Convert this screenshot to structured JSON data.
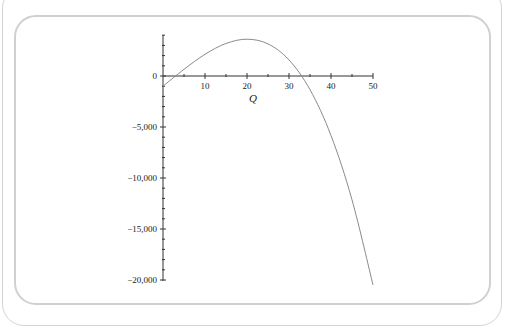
{
  "chart_data": {
    "type": "line",
    "title": "",
    "xlabel": "Q",
    "ylabel": "",
    "xlim": [
      0,
      50
    ],
    "ylim": [
      -20500,
      4000
    ],
    "x_ticks": [
      10,
      20,
      30,
      40,
      50
    ],
    "x_tick_labels": [
      "10",
      "20",
      "30",
      "40",
      "50"
    ],
    "y_ticks": [
      0,
      -5000,
      -10000,
      -15000,
      -20000
    ],
    "y_tick_labels": [
      "0",
      "-5,000",
      "-10,000",
      "-15,000",
      "-20,000"
    ],
    "grid": false,
    "legend": null,
    "series": [
      {
        "name": "P(Q)",
        "color": "#8a8a8a",
        "x": [
          0,
          5,
          10,
          15,
          20,
          25,
          30,
          35,
          40,
          45,
          50
        ],
        "y": [
          -1000,
          653,
          2127,
          3189,
          3608,
          3148,
          1576,
          -1340,
          -5834,
          -12139,
          -20487
        ]
      }
    ]
  }
}
